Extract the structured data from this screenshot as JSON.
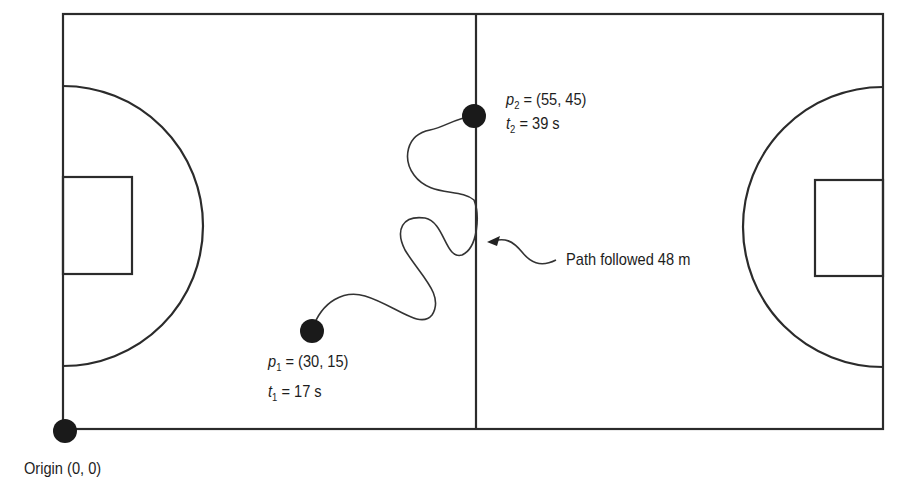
{
  "diagram": {
    "type": "basketball-court-displacement",
    "colors": {
      "line": "#2b2b2b",
      "dot": "#1a1a1a",
      "text": "#1d1d1d",
      "background": "#ffffff"
    },
    "court": {
      "left": 63,
      "top": 14,
      "right": 883,
      "bottom": 429,
      "center_x": 476
    },
    "points": [
      {
        "id": "p1",
        "symbol": "p",
        "subscript": "1",
        "coords": "(30, 15)",
        "time_symbol": "t",
        "time_subscript": "1",
        "time": "17 s"
      },
      {
        "id": "p2",
        "symbol": "p",
        "subscript": "2",
        "coords": "(55, 45)",
        "time_symbol": "t",
        "time_subscript": "2",
        "time": "39 s"
      }
    ],
    "path_label": "Path followed 48 m",
    "origin_label": "Origin (0, 0)",
    "eq": "= "
  }
}
